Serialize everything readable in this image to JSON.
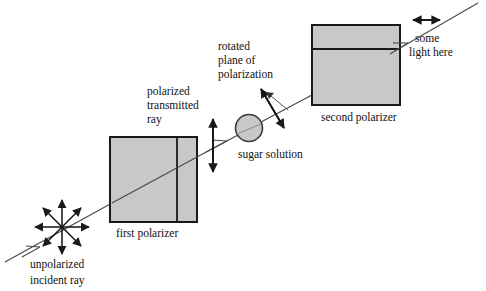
{
  "diagram": {
    "background_color": "#ffffff",
    "stroke_color": "#1a1a1a",
    "fill_gray": "#c8c8c8",
    "labels": {
      "unpolarized_line1": "unpolarized",
      "unpolarized_line2": "incident ray",
      "first_polarizer": "first polarizer",
      "polarized_line1": "polarized",
      "polarized_line2": "transmitted",
      "polarized_line3": "ray",
      "sugar_solution": "sugar solution",
      "rotated_line1": "rotated",
      "rotated_line2": "plane of",
      "rotated_line3": "polarization",
      "second_polarizer": "second polarizer",
      "some_light_line1": "some",
      "some_light_line2": "light here"
    },
    "elements": {
      "incident_ray": "diagonal light ray travelling up and to the right",
      "unpolarized_starburst": "eight-pointed double arrow star showing unpolarized vibration directions",
      "vertical_double_arrow": "vertical double-headed arrow showing vertical plane of polarization",
      "tilted_double_arrow": "tilted double-headed arrow showing rotated plane of polarization",
      "horizontal_double_arrow": "horizontal double-headed arrow showing transmitted component",
      "sugar_circle": "shaded circle representing the sugar solution sample",
      "first_polarizer_box": "shaded rectangle with vertical transmission-axis line",
      "second_polarizer_box": "shaded rectangle with horizontal transmission-axis line"
    }
  }
}
